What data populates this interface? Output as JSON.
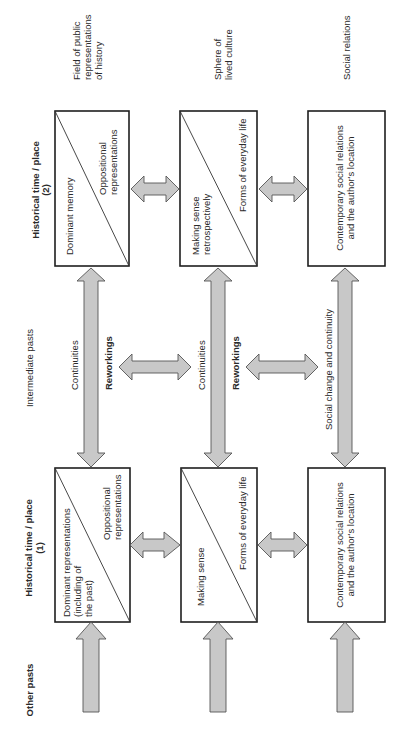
{
  "header_cropped": "Making histories / Sphere of lived culture",
  "rows": {
    "other_pasts": "Other pasts",
    "time1": [
      "Historical time / place",
      "(1)"
    ],
    "intermediate": "Intermediate pasts",
    "time2": [
      "Historical time / place",
      "(2)"
    ]
  },
  "columns": {
    "public": [
      "Field of public",
      "representations",
      "of history"
    ],
    "lived": [
      "Sphere of",
      "lived culture"
    ],
    "social": "Social relations"
  },
  "boxes": {
    "t2_public": {
      "left": "Dominant memory",
      "right": [
        "Oppositional",
        "representations"
      ]
    },
    "t2_lived": {
      "left": [
        "Making sense",
        "retrospectively"
      ],
      "right": "Forms of everyday life"
    },
    "t2_social": [
      "Contemporary social relations",
      "and the author's location"
    ],
    "t1_public": {
      "left": [
        "Dominant representations",
        "(including of",
        "the past)"
      ],
      "right": [
        "Oppositional",
        "representations"
      ]
    },
    "t1_lived": {
      "left": "Making sense",
      "right": "Forms of everyday life"
    },
    "t1_social": [
      "Contemporary social relations",
      "and the author's location"
    ]
  },
  "arrow_labels": {
    "continuities": "Continuities",
    "reworkings": "Reworkings",
    "social_change": "Social change and continuity"
  },
  "colors": {
    "arrow_fill": "#c8c8c8",
    "box_stroke": "#1e1e1e"
  }
}
